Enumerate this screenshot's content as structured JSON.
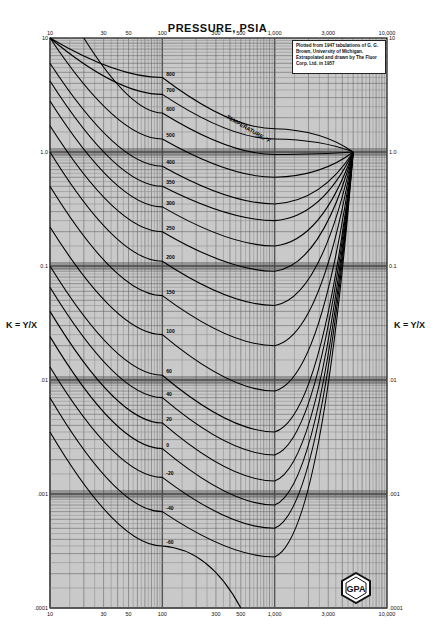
{
  "chart_data": {
    "type": "line",
    "title": "PRESSURE, PSIA",
    "xlabel": "PRESSURE, PSIA",
    "ylabel": "K = Y/X",
    "xscale": "log",
    "yscale": "log",
    "xlim": [
      10,
      10000
    ],
    "ylim": [
      0.0001,
      10
    ],
    "grid": true,
    "x_tick_labels": [
      "10",
      "20",
      "30",
      "40",
      "50",
      "60",
      "70",
      "80",
      "90",
      "100",
      "200",
      "300",
      "400",
      "500",
      "600",
      "700",
      "800",
      "900",
      "1,000",
      "2,000",
      "3,000",
      "4,000",
      "5,000",
      "6,000",
      "7,000",
      "8,000",
      "9,000",
      "10,000"
    ],
    "x_major_labels": [
      "10",
      "30",
      "50",
      "100",
      "300",
      "500",
      "1,000",
      "3,000",
      "10,000"
    ],
    "y_major_labels": [
      "10",
      "1.0",
      "0.1",
      ".01",
      ".001",
      ".0001"
    ],
    "legend": "TEMPERATURE, °F",
    "annotation": "Plotted from 1947 tabulations of G. G. Brown, University of Michigan. Extrapolated and drawn by The Fluor Corp. Ltd. in 1957",
    "logo": "GPA",
    "convergence_pressure_psia": 5000,
    "series": [
      {
        "name": "800°F",
        "points": [
          [
            10,
            10
          ],
          [
            100,
            4.5
          ],
          [
            1000,
            1.6
          ],
          [
            5000,
            1.0
          ]
        ]
      },
      {
        "name": "700°F",
        "points": [
          [
            10,
            10
          ],
          [
            100,
            3.2
          ],
          [
            1000,
            1.3
          ],
          [
            5000,
            1.0
          ]
        ]
      },
      {
        "name": "600°F",
        "points": [
          [
            20,
            10
          ],
          [
            100,
            2.2
          ],
          [
            1000,
            0.95
          ],
          [
            5000,
            1.0
          ]
        ]
      },
      {
        "name": "500°F",
        "points": [
          [
            10,
            10
          ],
          [
            100,
            1.3
          ],
          [
            1000,
            0.6
          ],
          [
            5000,
            1.0
          ]
        ]
      },
      {
        "name": "400°F",
        "points": [
          [
            10,
            6
          ],
          [
            100,
            0.75
          ],
          [
            1000,
            0.35
          ],
          [
            5000,
            1.0
          ]
        ]
      },
      {
        "name": "350°F",
        "points": [
          [
            10,
            4.2
          ],
          [
            100,
            0.5
          ],
          [
            1000,
            0.25
          ],
          [
            5000,
            1.0
          ]
        ]
      },
      {
        "name": "300°F",
        "points": [
          [
            10,
            2.8
          ],
          [
            100,
            0.33
          ],
          [
            1000,
            0.15
          ],
          [
            5000,
            1.0
          ]
        ]
      },
      {
        "name": "250°F",
        "points": [
          [
            10,
            1.7
          ],
          [
            100,
            0.2
          ],
          [
            1000,
            0.09
          ],
          [
            5000,
            1.0
          ]
        ]
      },
      {
        "name": "200°F",
        "points": [
          [
            10,
            1.0
          ],
          [
            100,
            0.11
          ],
          [
            1000,
            0.045
          ],
          [
            5000,
            1.0
          ]
        ]
      },
      {
        "name": "150°F",
        "points": [
          [
            10,
            0.5
          ],
          [
            100,
            0.055
          ],
          [
            1000,
            0.02
          ],
          [
            5000,
            1.0
          ]
        ]
      },
      {
        "name": "100°F",
        "points": [
          [
            10,
            0.22
          ],
          [
            100,
            0.025
          ],
          [
            1000,
            0.008
          ],
          [
            5000,
            1.0
          ]
        ]
      },
      {
        "name": "60°F",
        "points": [
          [
            10,
            0.1
          ],
          [
            100,
            0.011
          ],
          [
            1000,
            0.0035
          ],
          [
            5000,
            1.0
          ]
        ]
      },
      {
        "name": "40°F",
        "points": [
          [
            10,
            0.065
          ],
          [
            100,
            0.007
          ],
          [
            1000,
            0.0022
          ],
          [
            5000,
            1.0
          ]
        ]
      },
      {
        "name": "20°F",
        "points": [
          [
            10,
            0.04
          ],
          [
            100,
            0.0042
          ],
          [
            1000,
            0.0013
          ],
          [
            5000,
            1.0
          ]
        ]
      },
      {
        "name": "0°F",
        "points": [
          [
            10,
            0.024
          ],
          [
            100,
            0.0025
          ],
          [
            1000,
            0.0008
          ],
          [
            5000,
            1.0
          ]
        ]
      },
      {
        "name": "-20°F",
        "points": [
          [
            10,
            0.013
          ],
          [
            100,
            0.0014
          ],
          [
            1000,
            0.0005
          ],
          [
            5000,
            1.0
          ]
        ]
      },
      {
        "name": "-40°F",
        "points": [
          [
            10,
            0.007
          ],
          [
            100,
            0.0007
          ],
          [
            1000,
            0.00028
          ],
          [
            5000,
            1.0
          ]
        ]
      },
      {
        "name": "-60°F",
        "points": [
          [
            10,
            0.0035
          ],
          [
            100,
            0.00035
          ],
          [
            500,
            0.0001
          ]
        ]
      }
    ]
  },
  "labels": {
    "title": "PRESSURE, PSIA",
    "ylabel_left": "K = Y/X",
    "ylabel_right": "K = Y/X",
    "temperature_label": "TEMPERATURE, °F",
    "note": "Plotted from 1947 tabulations of G. G. Brown, University of Michigan. Extrapolated and drawn by The Fluor Corp. Ltd. in 1957",
    "logo_text": "GPA"
  }
}
